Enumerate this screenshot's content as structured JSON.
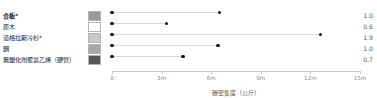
{
  "chart_data": {
    "type": "bar",
    "subtype": "lollipop-range",
    "title": "",
    "xlabel": "碳密集度（公斤）",
    "ylabel": "",
    "xlim": [
      0,
      15
    ],
    "x_tick_values": [
      0,
      3,
      6,
      9,
      12,
      15
    ],
    "x_tick_labels": [
      "0",
      "3m",
      "6m",
      "9m",
      "12m",
      "15m"
    ],
    "grid": false,
    "legend_position": "left-inline",
    "categories": [
      "合板*",
      "原木",
      "道格拉斯冷杉*",
      "鋼",
      "無塑化劑聚氯乙烯（硬管）"
    ],
    "series": [
      {
        "name": "起點",
        "values": [
          0.0,
          0.0,
          0.0,
          0.0,
          0.0
        ]
      },
      {
        "name": "終點",
        "values": [
          6.5,
          3.3,
          12.6,
          6.4,
          4.3
        ]
      }
    ],
    "value_column_header": "",
    "value_column": [
      "1.0",
      "0.6",
      "1.9",
      "1.0",
      "0.7"
    ],
    "swatch_colors": [
      "#9a9a9a",
      "#ffffff",
      "#c9c9c9",
      "#a8a8a8",
      "#575757"
    ],
    "dot_color": "#111111",
    "line_color": "#d8d8d8",
    "axis_color": "#c9c9c9",
    "tick_label_color": "#8a8a8a",
    "rows": [
      {
        "label": "合板*",
        "bold": true,
        "swatch": "#9a9a9a",
        "start": 0.0,
        "end": 6.5,
        "value": "1.0"
      },
      {
        "label": "原木",
        "bold": false,
        "swatch": "#ffffff",
        "start": 0.0,
        "end": 3.3,
        "value": "0.6"
      },
      {
        "label": "道格拉斯冷杉*",
        "bold": false,
        "swatch": "#c9c9c9",
        "start": 0.0,
        "end": 12.6,
        "value": "1.9"
      },
      {
        "label": "鋼",
        "bold": false,
        "swatch": "#a8a8a8",
        "start": 0.0,
        "end": 6.4,
        "value": "1.0"
      },
      {
        "label": "無塑化劑聚氯乙烯（硬管）",
        "bold": false,
        "swatch": "#575757",
        "start": 0.0,
        "end": 4.3,
        "value": "0.7"
      }
    ]
  }
}
